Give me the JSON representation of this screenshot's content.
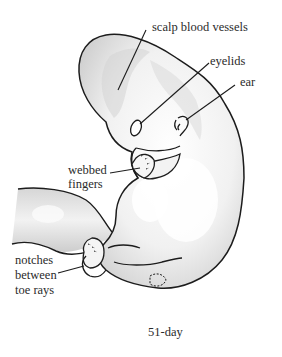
{
  "figure": {
    "caption": "51-day",
    "colors": {
      "outline": "#1c1c1c",
      "shading": "#c8c8c8",
      "highlight": "#f7f7f7",
      "text": "#2b2b2b"
    }
  },
  "labels": {
    "scalp_blood_vessels": "scalp blood vessels",
    "eyelids": "eyelids",
    "ear": "ear",
    "webbed_fingers_line1": "webbed",
    "webbed_fingers_line2": "fingers",
    "notches_line1": "notches",
    "notches_line2": "between",
    "notches_line3": "toe rays"
  }
}
